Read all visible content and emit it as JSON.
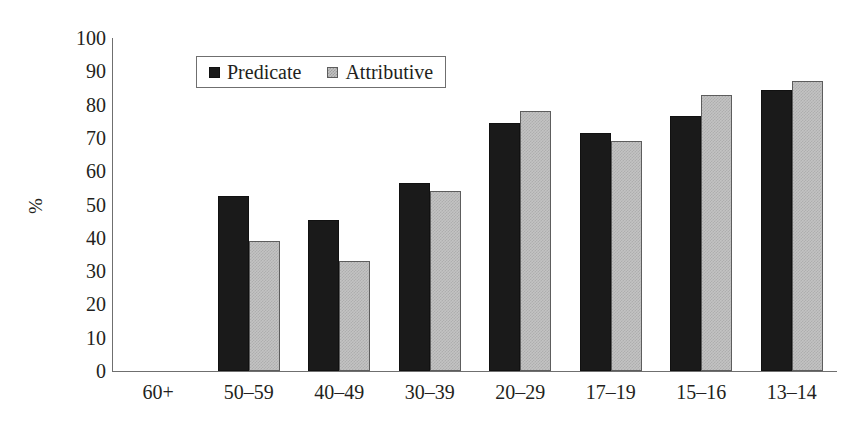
{
  "chart_data": {
    "type": "bar",
    "title": "",
    "xlabel": "",
    "ylabel": "%",
    "ylim": [
      0,
      100
    ],
    "ytick_step": 10,
    "yticks": [
      100,
      90,
      80,
      70,
      60,
      50,
      40,
      30,
      20,
      10,
      0
    ],
    "grid": false,
    "legend_position": "upper-left-inside",
    "categories": [
      "60+",
      "50–59",
      "40–49",
      "30–39",
      "20–29",
      "17–19",
      "15–16",
      "13–14"
    ],
    "series": [
      {
        "name": "Predicate",
        "swatch": "black-solid",
        "color": "#1a1a1a",
        "values": [
          0,
          52.5,
          45.5,
          56.5,
          74.5,
          71.5,
          76.5,
          84.5
        ]
      },
      {
        "name": "Attributive",
        "swatch": "gray-checkered",
        "color": "#c3c3c3",
        "values": [
          0,
          39,
          33,
          54,
          78,
          69,
          83,
          87
        ]
      }
    ]
  },
  "legend": {
    "items": [
      {
        "label": "Predicate",
        "marker": "square-black-icon"
      },
      {
        "label": "Attributive",
        "marker": "square-gray-icon"
      }
    ]
  },
  "colors": {
    "predicate": "#1a1a1a",
    "attributive": "#c3c3c3",
    "axis": "#6f6f6f",
    "text": "#231f20",
    "background": "#ffffff"
  }
}
